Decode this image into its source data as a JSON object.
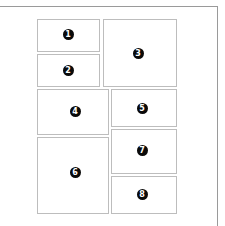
{
  "diagram": {
    "type": "page-layout-wireframe",
    "colors": {
      "frame_border": "#9a9a9a",
      "panel_border": "#bdbdbd",
      "badge_fill": "#0a0a0a",
      "badge_text": "#ffffff",
      "background": "#ffffff"
    },
    "panels": [
      {
        "label": "1",
        "x": 37,
        "y": 19,
        "w": 63,
        "h": 33,
        "cx": 68,
        "cy": 34
      },
      {
        "label": "2",
        "x": 37,
        "y": 54,
        "w": 63,
        "h": 33,
        "cx": 68,
        "cy": 70
      },
      {
        "label": "3",
        "x": 103,
        "y": 19,
        "w": 74,
        "h": 68,
        "cx": 138,
        "cy": 53
      },
      {
        "label": "4",
        "x": 37,
        "y": 89,
        "w": 72,
        "h": 46,
        "cx": 75,
        "cy": 111
      },
      {
        "label": "5",
        "x": 111,
        "y": 89,
        "w": 66,
        "h": 38,
        "cx": 142,
        "cy": 108
      },
      {
        "label": "6",
        "x": 37,
        "y": 137,
        "w": 72,
        "h": 77,
        "cx": 75,
        "cy": 172
      },
      {
        "label": "7",
        "x": 111,
        "y": 129,
        "w": 66,
        "h": 45,
        "cx": 142,
        "cy": 150
      },
      {
        "label": "8",
        "x": 111,
        "y": 176,
        "w": 66,
        "h": 38,
        "cx": 142,
        "cy": 194
      }
    ]
  }
}
